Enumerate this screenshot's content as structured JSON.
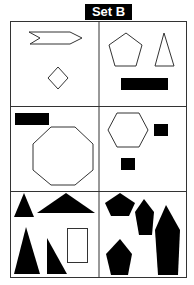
{
  "header": {
    "title": "Set B"
  },
  "colors": {
    "stroke": "#333333",
    "fill": "#000000",
    "background": "#ffffff"
  },
  "grid": {
    "rows": 3,
    "columns": 2,
    "cells": [
      {
        "id": "r1c1",
        "shapes": [
          "arrow-chevron-outline",
          "diamond-outline"
        ]
      },
      {
        "id": "r1c2",
        "shapes": [
          "pentagon-outline",
          "triangle-outline",
          "rectangle-filled"
        ]
      },
      {
        "id": "r2c1",
        "shapes": [
          "rectangle-filled",
          "octagon-outline"
        ]
      },
      {
        "id": "r2c2",
        "shapes": [
          "hexagon-outline",
          "square-filled",
          "square-filled"
        ]
      },
      {
        "id": "r3c1",
        "shapes": [
          "triangle-filled",
          "triangle-filled-wide",
          "triangle-filled-tall",
          "triangle-filled-right",
          "rectangle-outline"
        ]
      },
      {
        "id": "r3c2",
        "shapes": [
          "pentagon-filled",
          "pentagon-filled-tall",
          "hexagon-filled-elongated",
          "pentagon-filled"
        ]
      }
    ]
  }
}
